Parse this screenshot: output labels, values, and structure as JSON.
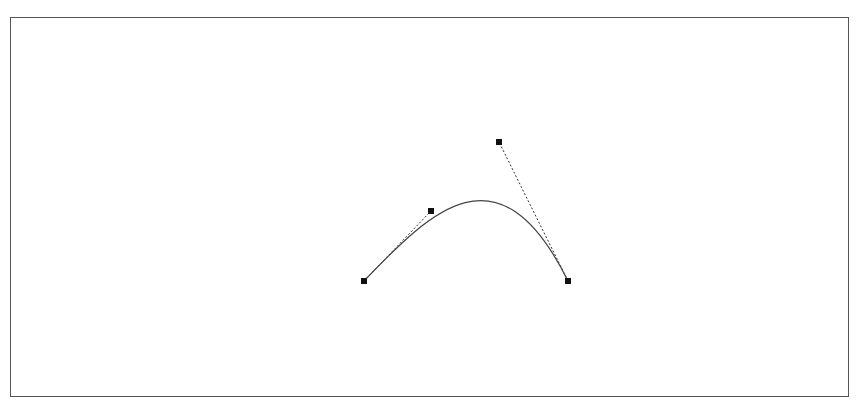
{
  "diagram": {
    "type": "cubic-bezier",
    "colors": {
      "curve": "#444444",
      "handle_line": "#333333",
      "control_point": "#111111",
      "frame_border": "#555555",
      "background": "#ffffff"
    },
    "points": [
      {
        "id": "p0",
        "role": "start-anchor",
        "x": 364,
        "y": 281
      },
      {
        "id": "p1",
        "role": "control-handle-1",
        "x": 431,
        "y": 211
      },
      {
        "id": "p2",
        "role": "control-handle-2",
        "x": 499,
        "y": 142
      },
      {
        "id": "p3",
        "role": "end-anchor",
        "x": 568,
        "y": 281
      }
    ]
  }
}
